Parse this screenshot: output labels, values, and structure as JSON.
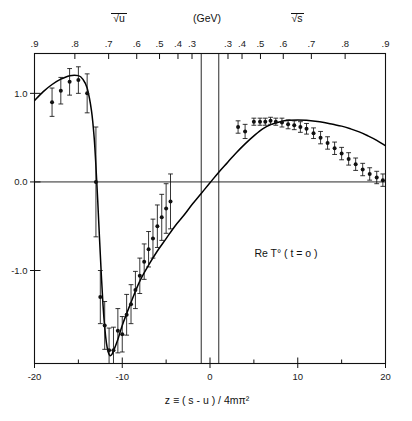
{
  "figure": {
    "annotation": "Re T° ( t = o )",
    "xlabel": "z ≡ ( s - u ) / 4mπ²",
    "top_axis_unit": "(GeV)",
    "top_axis_left_name": "√u",
    "top_axis_right_name": "√s"
  },
  "chart_data": {
    "type": "line",
    "title": "",
    "subtitle": "",
    "xlabel": "z ≡ (s-u)/4mπ²",
    "ylabel": "Re T⁰(t=0)",
    "xlim": [
      -20,
      20
    ],
    "ylim": [
      -2.05,
      1.45
    ],
    "grid": false,
    "legend": "none",
    "x_ticks": [
      -20,
      -10,
      0,
      10,
      20
    ],
    "x_tick_labels": [
      "-20",
      "-10",
      "0",
      "10",
      "20"
    ],
    "x_minor_ticks": [
      -15,
      -5,
      5,
      15
    ],
    "y_ticks": [
      1.0,
      0.0,
      -1.0
    ],
    "y_tick_labels": [
      "1.0",
      "0.0",
      "-1.0"
    ],
    "top_axis_left": {
      "name": "√u",
      "unit": "(GeV)",
      "tick_labels": [
        ".9",
        ".8",
        ".7",
        ".6",
        ".5",
        ".4",
        ".3"
      ],
      "tick_z": [
        -20.0,
        -15.4,
        -11.55,
        -8.35,
        -5.75,
        -3.65,
        -2.05
      ]
    },
    "top_axis_right": {
      "name": "√s",
      "unit": "(GeV)",
      "tick_labels": [
        ".3",
        ".4",
        ".5",
        ".6",
        ".7",
        ".8",
        ".9"
      ],
      "tick_z": [
        2.05,
        3.65,
        5.75,
        8.35,
        11.55,
        15.4,
        20.0
      ]
    },
    "threshold_lines_z": [
      -1.0,
      1.0
    ],
    "zero_line_y": 0.0,
    "series": [
      {
        "name": "theory curve",
        "type": "line",
        "x": [
          -20.0,
          -19.0,
          -18.0,
          -17.0,
          -16.0,
          -15.0,
          -14.5,
          -14.0,
          -13.5,
          -13.2,
          -13.0,
          -12.8,
          -12.6,
          -12.4,
          -12.2,
          -12.0,
          -11.8,
          -11.6,
          -11.4,
          -11.2,
          -11.0,
          -10.5,
          -10.0,
          -9.0,
          -8.0,
          -7.0,
          -6.0,
          -5.0,
          -4.0,
          -3.0,
          -2.0,
          -1.0,
          0.0,
          1.0,
          2.0,
          3.0,
          4.0,
          5.0,
          6.0,
          7.0,
          8.0,
          9.0,
          10.0,
          11.0,
          12.0,
          13.0,
          14.0,
          15.0,
          16.0,
          17.0,
          18.0,
          19.0,
          20.0
        ],
        "y": [
          0.92,
          1.02,
          1.1,
          1.16,
          1.2,
          1.2,
          1.16,
          1.06,
          0.8,
          0.5,
          0.18,
          -0.2,
          -0.62,
          -1.02,
          -1.38,
          -1.64,
          -1.82,
          -1.92,
          -1.96,
          -1.95,
          -1.91,
          -1.78,
          -1.62,
          -1.36,
          -1.12,
          -0.94,
          -0.78,
          -0.64,
          -0.5,
          -0.38,
          -0.25,
          -0.13,
          -0.01,
          0.11,
          0.22,
          0.33,
          0.43,
          0.52,
          0.6,
          0.65,
          0.68,
          0.695,
          0.7,
          0.695,
          0.685,
          0.67,
          0.65,
          0.63,
          0.6,
          0.565,
          0.52,
          0.47,
          0.41
        ]
      },
      {
        "name": "data points",
        "type": "scatter_errorbar",
        "x": [
          -18.0,
          -17.0,
          -16.0,
          -15.0,
          -14.0,
          -13.0,
          -12.5,
          -12.0,
          -11.5,
          -11.0,
          -10.5,
          -10.0,
          -9.5,
          -9.0,
          -8.5,
          -8.0,
          -7.5,
          -7.0,
          -6.5,
          -6.0,
          -5.5,
          -5.0,
          -4.5,
          3.2,
          4.0,
          5.0,
          5.7,
          6.3,
          6.9,
          7.5,
          8.2,
          8.9,
          9.6,
          10.3,
          11.0,
          11.8,
          12.6,
          13.4,
          14.2,
          15.0,
          15.8,
          16.6,
          17.4,
          18.2,
          19.0,
          19.7
        ],
        "y": [
          0.9,
          1.03,
          1.13,
          1.15,
          1.0,
          0.0,
          -1.3,
          -1.62,
          -1.9,
          -1.9,
          -1.68,
          -1.72,
          -1.5,
          -1.38,
          -1.22,
          -1.06,
          -0.9,
          -0.76,
          -0.64,
          -0.5,
          -0.4,
          -0.3,
          -0.22,
          0.62,
          0.57,
          0.68,
          0.68,
          0.68,
          0.69,
          0.68,
          0.67,
          0.65,
          0.64,
          0.62,
          0.6,
          0.55,
          0.5,
          0.44,
          0.38,
          0.32,
          0.26,
          0.2,
          0.14,
          0.09,
          0.05,
          0.02
        ],
        "yerr": [
          0.16,
          0.15,
          0.15,
          0.15,
          0.22,
          0.62,
          0.3,
          0.27,
          0.25,
          0.26,
          0.25,
          0.2,
          0.23,
          0.22,
          0.21,
          0.2,
          0.2,
          0.2,
          0.22,
          0.24,
          0.26,
          0.28,
          0.31,
          0.07,
          0.08,
          0.04,
          0.04,
          0.04,
          0.04,
          0.04,
          0.05,
          0.05,
          0.05,
          0.06,
          0.06,
          0.06,
          0.07,
          0.07,
          0.07,
          0.07,
          0.07,
          0.07,
          0.07,
          0.07,
          0.07,
          0.07
        ]
      }
    ]
  },
  "colors": {
    "ink": "#111111",
    "curve": "#000000",
    "background": "#ffffff"
  }
}
